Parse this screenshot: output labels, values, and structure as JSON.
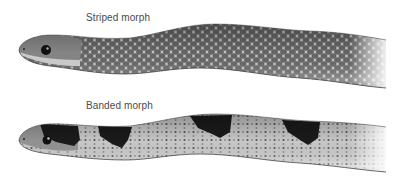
{
  "figure": {
    "panels": [
      {
        "id": "striped",
        "caption": "Striped morph",
        "subject": "snake-striped-morph"
      },
      {
        "id": "banded",
        "caption": "Banded morph",
        "subject": "snake-banded-morph"
      }
    ],
    "colors": {
      "background": "#ffffff",
      "caption_text": "#4a4a4a",
      "scale_light": "#d6d6d6",
      "scale_dark": "#6e6e6e",
      "band_dark": "#1c1c1c",
      "belly": "#e2e2e2"
    }
  }
}
